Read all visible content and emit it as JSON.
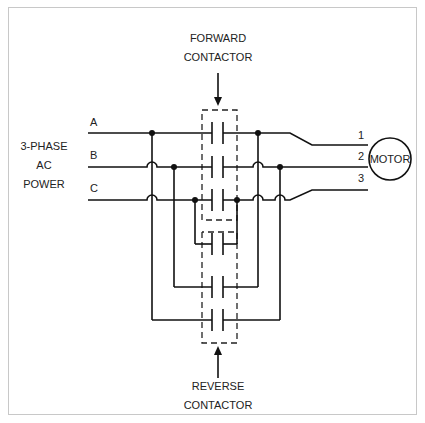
{
  "diagram": {
    "title_top": [
      "FORWARD",
      "CONTACTOR"
    ],
    "title_bottom": [
      "REVERSE",
      "CONTACTOR"
    ],
    "source_label": [
      "3-PHASE",
      "AC",
      "POWER"
    ],
    "phases": [
      "A",
      "B",
      "C"
    ],
    "motor_terminals": [
      "1",
      "2",
      "3"
    ],
    "motor_label": "MOTOR",
    "colors": {
      "line": "#111111",
      "frame": "#c8c8c8",
      "background": "#ffffff"
    }
  }
}
